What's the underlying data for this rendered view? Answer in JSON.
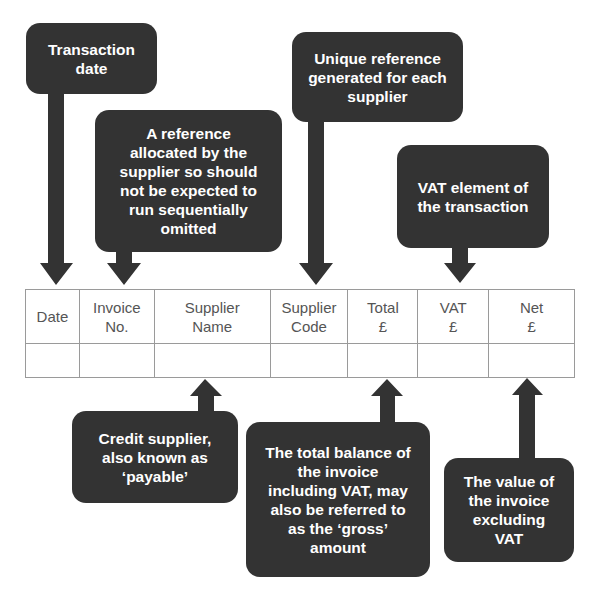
{
  "diagram": {
    "colors": {
      "callout_fill": "#333333",
      "callout_text": "#ffffff",
      "table_border": "#9a9a9a",
      "table_text": "#555555"
    },
    "table": {
      "columns": [
        {
          "label": "Date"
        },
        {
          "label": "Invoice\nNo."
        },
        {
          "label": "Supplier\nName"
        },
        {
          "label": "Supplier\nCode"
        },
        {
          "label": "Total\n£"
        },
        {
          "label": "VAT\n£"
        },
        {
          "label": "Net\n£"
        }
      ],
      "rows": [
        [
          "",
          "",
          "",
          "",
          "",
          "",
          ""
        ]
      ]
    },
    "callouts": {
      "transaction_date": "Transaction\ndate",
      "invoice_no": "A reference\nallocated by the\nsupplier so should\nnot be expected to\nrun sequentially\nomitted",
      "supplier_code": "Unique reference\ngenerated for each\nsupplier",
      "vat": "VAT element of\nthe transaction",
      "supplier_name": "Credit supplier,\nalso known as\n‘payable’",
      "total": "The total balance of\nthe invoice\nincluding VAT, may\nalso be referred to\nas the ‘gross’\namount",
      "net": "The value of\nthe invoice\nexcluding\nVAT"
    }
  }
}
